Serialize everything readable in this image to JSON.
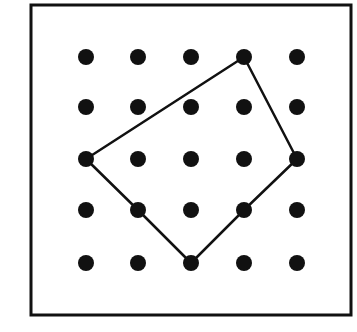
{
  "diagram": {
    "type": "geoboard",
    "frame": {
      "x1": 31,
      "y1": 5,
      "x2": 351,
      "y2": 315,
      "stroke": "#111111",
      "stroke_width": 3
    },
    "grid": {
      "columns": 5,
      "rows": 5,
      "x": [
        86,
        138,
        191,
        244,
        297
      ],
      "y": [
        57,
        107,
        159,
        210,
        263
      ],
      "dot_radius": 8,
      "dot_color": "#111111"
    },
    "polygon": {
      "vertices_grid": [
        [
          3,
          0
        ],
        [
          4,
          2
        ],
        [
          3,
          3
        ],
        [
          2,
          4
        ],
        [
          1,
          3
        ],
        [
          0,
          2
        ]
      ],
      "stroke": "#111111",
      "stroke_width": 2.5,
      "fill": "none"
    }
  }
}
